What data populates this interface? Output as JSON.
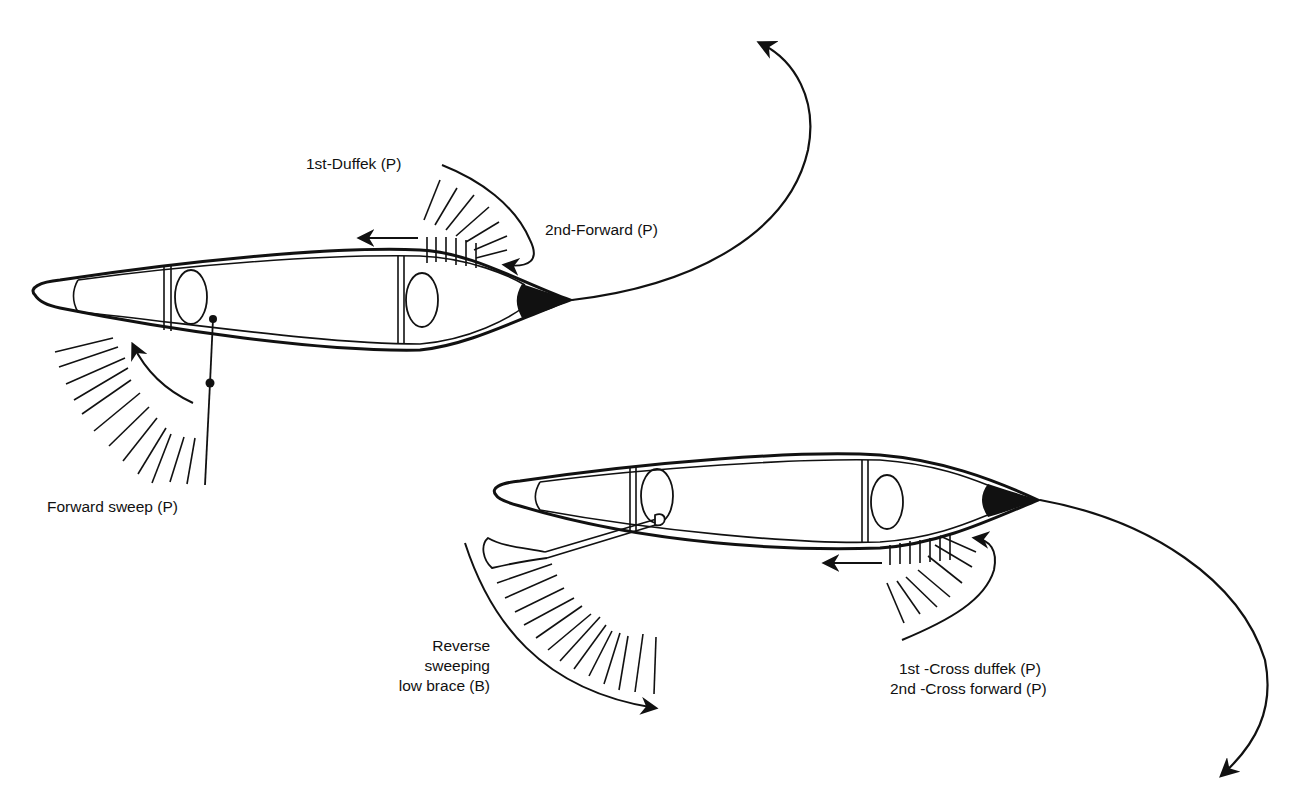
{
  "diagram": {
    "type": "canoe-stroke-diagram",
    "colors": {
      "ink": "#111111",
      "background": "#ffffff"
    },
    "canoes": [
      {
        "id": "canoe-top",
        "strokes": [
          {
            "label": "1st-Duffek (P)"
          },
          {
            "label": "2nd-Forward (P)"
          },
          {
            "label": "Forward sweep (P)"
          }
        ]
      },
      {
        "id": "canoe-bottom",
        "strokes": [
          {
            "label_lines": [
              "Reverse",
              "sweeping",
              "low brace (B)"
            ]
          },
          {
            "label_lines": [
              "1st -Cross duffek (P)",
              "2nd -Cross forward (P)"
            ]
          }
        ]
      }
    ]
  },
  "labels": {
    "duffek": "1st-Duffek (P)",
    "forward": "2nd-Forward (P)",
    "forward_sweep": "Forward sweep (P)",
    "reverse_line1": "Reverse",
    "reverse_line2": "sweeping",
    "reverse_line3": "low brace (B)",
    "cross_line1": "1st -Cross duffek (P)",
    "cross_line2": "2nd -Cross forward (P)"
  }
}
